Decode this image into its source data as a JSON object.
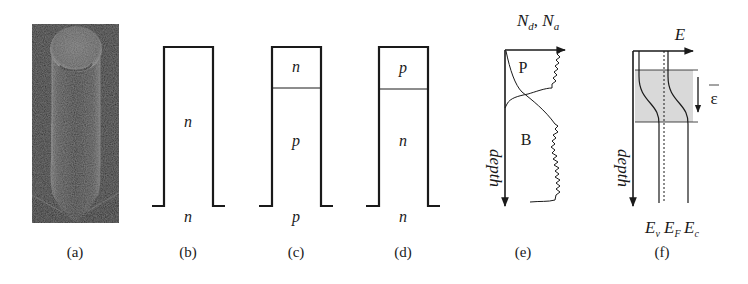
{
  "figure": {
    "panels": [
      {
        "id": "a",
        "label": "(a)",
        "type": "sem-micrograph",
        "description": "SEM image of a single nanopillar with a rounded cap"
      },
      {
        "id": "b",
        "label": "(b)",
        "type": "pillar-doping",
        "regions": [
          "n"
        ],
        "substrate": "n"
      },
      {
        "id": "c",
        "label": "(c)",
        "type": "pillar-doping",
        "regions": [
          "n",
          "p"
        ],
        "substrate": "p"
      },
      {
        "id": "d",
        "label": "(d)",
        "type": "pillar-doping",
        "regions": [
          "p",
          "n"
        ],
        "substrate": "n"
      },
      {
        "id": "e",
        "label": "(e)",
        "type": "doping-profile",
        "x_axis": {
          "main": "N",
          "sub1": "d",
          "sep": ", ",
          "main2": "N",
          "sub2": "a"
        },
        "y_axis": "depth",
        "curves": [
          "P",
          "B"
        ]
      },
      {
        "id": "f",
        "label": "(f)",
        "type": "band-diagram",
        "x_axis": "E",
        "y_axis": "depth",
        "field_symbol": "ε",
        "bands": [
          {
            "main": "E",
            "sub": "v"
          },
          {
            "main": "E",
            "sub": "F"
          },
          {
            "main": "E",
            "sub": "c"
          }
        ]
      }
    ],
    "colors": {
      "line": "#1a1a1a",
      "shade": "#d9d9d9",
      "sem_bg": "#2a2a2a"
    }
  }
}
